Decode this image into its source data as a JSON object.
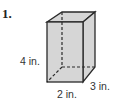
{
  "problem": {
    "number": "1.",
    "figure": "rectangular prism",
    "labels": {
      "height": "4 in.",
      "width": "2 in.",
      "depth": "3 in."
    },
    "colors": {
      "fill": "#d6d6d6",
      "stroke": "#2a2a2a",
      "hidden_edge": "#2a2a2a"
    }
  }
}
